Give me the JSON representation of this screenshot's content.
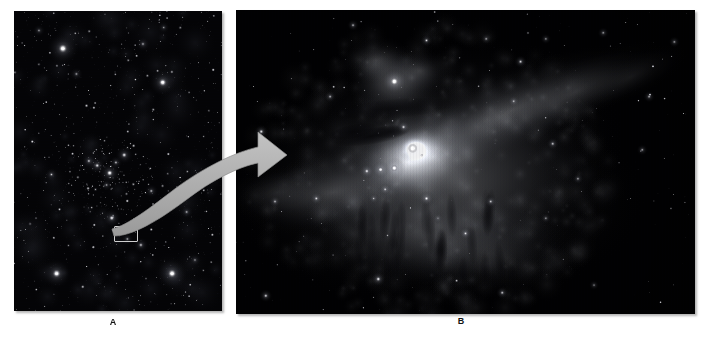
{
  "figure": {
    "kind": "two-panel-astronomical-image",
    "background_color": "#ffffff"
  },
  "panels": [
    {
      "id": "panel-a",
      "label": "A",
      "caption_position": "below-center",
      "subject": "wide-field-star-cluster",
      "background_color": "#000000",
      "has_highlight_box": true,
      "highlight_box_color": "#cfcfcf"
    },
    {
      "id": "panel-b",
      "label": "B",
      "caption_position": "below-center",
      "subject": "orion-nebula-closeup",
      "background_color": "#000000",
      "has_highlight_box": false
    }
  ],
  "annotation": {
    "arrow": {
      "name": "zoom-callout-arrow",
      "color": "#a8a8a8",
      "stroke_color": "#8c8c8c",
      "direction": "left-to-right-curved",
      "from": "panel-a-highlight-box",
      "to": "panel-b"
    }
  },
  "chart_data": {
    "type": "scatter",
    "title": "",
    "xlabel": "",
    "ylabel": "",
    "panel_a": {
      "label": "A",
      "description": "Wide-field view of a star cluster with a small boxed region marking the nebula",
      "field_box_normalized": {
        "x": 0.413,
        "y": 0.68,
        "w": 0.115,
        "h": 0.053
      },
      "bright_stars": [
        {
          "x": 0.235,
          "y": 0.125,
          "r": 4.6,
          "i": 1.0
        },
        {
          "x": 0.715,
          "y": 0.238,
          "r": 4.0,
          "i": 0.96
        },
        {
          "x": 0.205,
          "y": 0.875,
          "r": 4.2,
          "i": 0.97
        },
        {
          "x": 0.76,
          "y": 0.875,
          "r": 4.4,
          "i": 1.0
        },
        {
          "x": 0.46,
          "y": 0.54,
          "r": 3.2,
          "i": 0.92
        },
        {
          "x": 0.4,
          "y": 0.515,
          "r": 2.4,
          "i": 0.82
        },
        {
          "x": 0.53,
          "y": 0.48,
          "r": 2.6,
          "i": 0.85
        },
        {
          "x": 0.36,
          "y": 0.5,
          "r": 2.0,
          "i": 0.75
        },
        {
          "x": 0.49,
          "y": 0.505,
          "r": 1.9,
          "i": 0.72
        },
        {
          "x": 0.445,
          "y": 0.58,
          "r": 1.7,
          "i": 0.66
        },
        {
          "x": 0.47,
          "y": 0.69,
          "r": 2.6,
          "i": 0.9
        },
        {
          "x": 0.66,
          "y": 0.6,
          "r": 2.0,
          "i": 0.7
        },
        {
          "x": 0.18,
          "y": 0.545,
          "r": 1.9,
          "i": 0.68
        },
        {
          "x": 0.61,
          "y": 0.78,
          "r": 2.2,
          "i": 0.74
        },
        {
          "x": 0.545,
          "y": 0.76,
          "r": 1.8,
          "i": 0.66
        },
        {
          "x": 0.83,
          "y": 0.67,
          "r": 1.9,
          "i": 0.68
        },
        {
          "x": 0.87,
          "y": 0.83,
          "r": 1.8,
          "i": 0.62
        },
        {
          "x": 0.3,
          "y": 0.21,
          "r": 1.9,
          "i": 0.62
        },
        {
          "x": 0.12,
          "y": 0.065,
          "r": 1.8,
          "i": 0.6
        },
        {
          "x": 0.62,
          "y": 0.11,
          "r": 2.0,
          "i": 0.66
        },
        {
          "x": 0.72,
          "y": 0.055,
          "r": 1.7,
          "i": 0.56
        }
      ],
      "star_count_estimate": 1200
    },
    "panel_b": {
      "label": "B",
      "description": "Close-up of the Orion Nebula (M42) showing bright central glow, dark lanes, and the Trapezium stars",
      "nebula_core_normalized": {
        "x": 0.4,
        "y": 0.46
      },
      "secondary_nebula_normalized": {
        "x": 0.35,
        "y": 0.23
      },
      "bright_stars": [
        {
          "x": 0.345,
          "y": 0.235,
          "r": 4.2,
          "i": 1.0
        },
        {
          "x": 0.385,
          "y": 0.455,
          "r": 4.8,
          "i": 1.0
        },
        {
          "x": 0.345,
          "y": 0.52,
          "r": 3.4,
          "i": 0.97
        },
        {
          "x": 0.315,
          "y": 0.525,
          "r": 2.8,
          "i": 0.9
        },
        {
          "x": 0.285,
          "y": 0.53,
          "r": 2.4,
          "i": 0.84
        },
        {
          "x": 0.365,
          "y": 0.385,
          "r": 2.2,
          "i": 0.8
        },
        {
          "x": 0.325,
          "y": 0.59,
          "r": 2.0,
          "i": 0.76
        },
        {
          "x": 0.415,
          "y": 0.62,
          "r": 2.4,
          "i": 0.86
        },
        {
          "x": 0.3,
          "y": 0.62,
          "r": 1.7,
          "i": 0.64
        },
        {
          "x": 0.175,
          "y": 0.62,
          "r": 2.1,
          "i": 0.76
        },
        {
          "x": 0.085,
          "y": 0.63,
          "r": 1.9,
          "i": 0.7
        },
        {
          "x": 0.055,
          "y": 0.4,
          "r": 2.3,
          "i": 0.82
        },
        {
          "x": 0.205,
          "y": 0.285,
          "r": 1.9,
          "i": 0.68
        },
        {
          "x": 0.255,
          "y": 0.05,
          "r": 1.9,
          "i": 0.68
        },
        {
          "x": 0.415,
          "y": 0.1,
          "r": 2.0,
          "i": 0.74
        },
        {
          "x": 0.545,
          "y": 0.095,
          "r": 1.8,
          "i": 0.64
        },
        {
          "x": 0.62,
          "y": 0.17,
          "r": 2.1,
          "i": 0.76
        },
        {
          "x": 0.675,
          "y": 0.095,
          "r": 1.7,
          "i": 0.6
        },
        {
          "x": 0.8,
          "y": 0.075,
          "r": 1.8,
          "i": 0.62
        },
        {
          "x": 0.955,
          "y": 0.105,
          "r": 1.8,
          "i": 0.62
        },
        {
          "x": 0.9,
          "y": 0.285,
          "r": 1.9,
          "i": 0.66
        },
        {
          "x": 0.605,
          "y": 0.3,
          "r": 1.9,
          "i": 0.68
        },
        {
          "x": 0.69,
          "y": 0.44,
          "r": 2.0,
          "i": 0.72
        },
        {
          "x": 0.885,
          "y": 0.46,
          "r": 1.8,
          "i": 0.64
        },
        {
          "x": 0.745,
          "y": 0.555,
          "r": 1.8,
          "i": 0.64
        },
        {
          "x": 0.555,
          "y": 0.63,
          "r": 2.0,
          "i": 0.72
        },
        {
          "x": 0.5,
          "y": 0.735,
          "r": 2.1,
          "i": 0.78
        },
        {
          "x": 0.675,
          "y": 0.685,
          "r": 1.7,
          "i": 0.6
        },
        {
          "x": 0.31,
          "y": 0.885,
          "r": 2.4,
          "i": 0.86
        },
        {
          "x": 0.065,
          "y": 0.94,
          "r": 2.1,
          "i": 0.78
        },
        {
          "x": 0.58,
          "y": 0.93,
          "r": 2.0,
          "i": 0.72
        },
        {
          "x": 0.78,
          "y": 0.905,
          "r": 1.6,
          "i": 0.56
        },
        {
          "x": 0.44,
          "y": 0.685,
          "r": 1.6,
          "i": 0.54
        }
      ],
      "star_count_estimate": 260
    }
  }
}
